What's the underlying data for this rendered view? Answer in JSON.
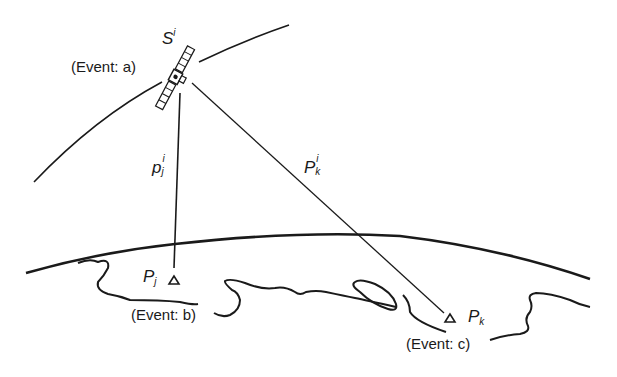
{
  "diagram": {
    "type": "satellite-geometry",
    "satellite": {
      "label_base": "S",
      "label_sup": "i",
      "event_label": "(Event: a)"
    },
    "ranges": [
      {
        "id": "pj",
        "label_base": "p",
        "label_sub": "j",
        "label_sup": "i"
      },
      {
        "id": "pk",
        "label_base": "P",
        "label_sub": "k",
        "label_sup": "i"
      }
    ],
    "stations": [
      {
        "id": "Pj",
        "label_base": "P",
        "label_sub": "j",
        "marker": "triangle",
        "event_label": "(Event: b)"
      },
      {
        "id": "Pk",
        "label_base": "P",
        "label_sub": "k",
        "marker": "triangle",
        "event_label": "(Event: c)"
      }
    ],
    "colors": {
      "ink": "#1a1a1a",
      "background": "#ffffff"
    }
  }
}
